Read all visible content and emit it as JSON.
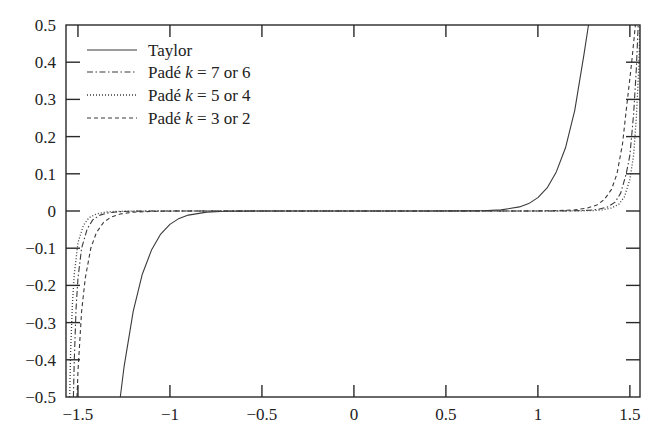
{
  "chart_data": {
    "type": "line",
    "title": "",
    "xlabel": "",
    "ylabel": "",
    "xlim": [
      -1.565,
      1.555
    ],
    "ylim": [
      -0.5,
      0.5
    ],
    "grid": false,
    "legend_position": "upper-left",
    "x_ticks": [
      -1.5,
      -1,
      -0.5,
      0,
      0.5,
      1,
      1.5
    ],
    "x_tick_labels": [
      "−1.5",
      "−1",
      "−0.5",
      "0",
      "0.5",
      "1",
      "1.5"
    ],
    "y_ticks": [
      0.5,
      0.4,
      0.3,
      0.2,
      0.1,
      0,
      -0.1,
      -0.2,
      -0.3,
      -0.4,
      -0.5
    ],
    "y_tick_labels": [
      "0.5",
      "0.4",
      "0.3",
      "0.2",
      "0.1",
      "0",
      "−0.1",
      "−0.2",
      "−0.3",
      "−0.4",
      "−0.5"
    ],
    "series": [
      {
        "name": "Taylor",
        "legend_prefix": "Taylor",
        "legend_k": "",
        "legend_suffix": "",
        "style": "solid",
        "x": [
          -1.27,
          -1.25,
          -1.2,
          -1.15,
          -1.1,
          -1.05,
          -1.0,
          -0.95,
          -0.9,
          -0.8,
          -0.7,
          -0.6,
          -0.4,
          0,
          0.4,
          0.6,
          0.7,
          0.8,
          0.9,
          0.95,
          1.0,
          1.05,
          1.1,
          1.15,
          1.2,
          1.25,
          1.275
        ],
        "y": [
          -0.5,
          -0.42,
          -0.27,
          -0.17,
          -0.105,
          -0.062,
          -0.036,
          -0.02,
          -0.011,
          -0.003,
          -0.0008,
          -0.0002,
          0,
          0,
          0,
          0.0002,
          0.0008,
          0.003,
          0.011,
          0.02,
          0.036,
          0.062,
          0.105,
          0.17,
          0.27,
          0.42,
          0.5
        ]
      },
      {
        "name": "Padé k = 7 or 6",
        "legend_prefix": "Padé ",
        "legend_k": "k",
        "legend_suffix": " = 7 or 6",
        "style": "dashdot",
        "x": [
          -1.525,
          -1.52,
          -1.51,
          -1.5,
          -1.48,
          -1.45,
          -1.42,
          -1.38,
          -1.33,
          -1.28,
          -1.2,
          -1.1,
          -1.0,
          0,
          1.0,
          1.1,
          1.2,
          1.28,
          1.33,
          1.38,
          1.42,
          1.45,
          1.48,
          1.5,
          1.52,
          1.535,
          1.545
        ],
        "y": [
          -0.5,
          -0.4,
          -0.26,
          -0.18,
          -0.1,
          -0.048,
          -0.024,
          -0.011,
          -0.0045,
          -0.0018,
          -0.0005,
          -0.0001,
          0,
          0,
          0,
          0.0001,
          0.0005,
          0.0018,
          0.0045,
          0.011,
          0.024,
          0.048,
          0.1,
          0.15,
          0.26,
          0.38,
          0.5
        ]
      },
      {
        "name": "Padé k = 5 or 4",
        "legend_prefix": "Padé ",
        "legend_k": "k",
        "legend_suffix": " = 5 or 4",
        "style": "dotted",
        "x": [
          -1.545,
          -1.54,
          -1.53,
          -1.52,
          -1.5,
          -1.47,
          -1.44,
          -1.4,
          -1.35,
          -1.3,
          -1.2,
          -1.1,
          -1.0,
          0,
          1.0,
          1.1,
          1.2,
          1.3,
          1.35,
          1.4,
          1.44,
          1.47,
          1.5,
          1.52,
          1.535,
          1.548,
          1.555
        ],
        "y": [
          -0.5,
          -0.38,
          -0.25,
          -0.17,
          -0.085,
          -0.038,
          -0.018,
          -0.008,
          -0.003,
          -0.0012,
          -0.0003,
          -0.0001,
          0,
          0,
          0,
          0.0001,
          0.0003,
          0.0012,
          0.003,
          0.008,
          0.018,
          0.038,
          0.085,
          0.15,
          0.25,
          0.38,
          0.5
        ]
      },
      {
        "name": "Padé k = 3 or 2",
        "legend_prefix": "Padé ",
        "legend_k": "k",
        "legend_suffix": " = 3 or 2",
        "style": "dashed",
        "x": [
          -1.505,
          -1.5,
          -1.48,
          -1.46,
          -1.43,
          -1.4,
          -1.36,
          -1.32,
          -1.27,
          -1.2,
          -1.1,
          -1.0,
          -0.9,
          0,
          0.9,
          1.0,
          1.1,
          1.2,
          1.27,
          1.32,
          1.36,
          1.4,
          1.43,
          1.46,
          1.48,
          1.51,
          1.53
        ],
        "y": [
          -0.5,
          -0.43,
          -0.27,
          -0.18,
          -0.1,
          -0.058,
          -0.03,
          -0.016,
          -0.008,
          -0.003,
          -0.001,
          -0.0003,
          0,
          0,
          0,
          0.0003,
          0.001,
          0.003,
          0.008,
          0.016,
          0.03,
          0.058,
          0.1,
          0.18,
          0.27,
          0.4,
          0.5
        ]
      }
    ]
  },
  "colors": {
    "background": "#ffffff",
    "axis": "#2a2a2a",
    "line": "#3a3a3a",
    "text": "#222222"
  },
  "layout": {
    "plot_left": 66,
    "plot_top": 25,
    "plot_right": 640,
    "plot_bottom": 397
  }
}
